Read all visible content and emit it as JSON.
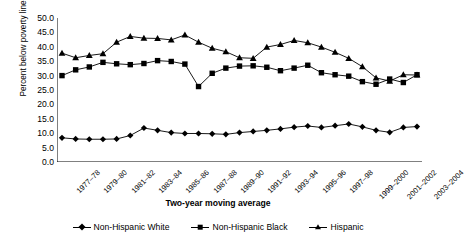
{
  "chart_data": {
    "type": "line",
    "title": "",
    "xlabel": "Two-year moving average",
    "ylabel": "Percent below poverty line",
    "ylim": [
      0.0,
      50.0
    ],
    "ytick_step": 5.0,
    "ytick_labels": [
      "50.0",
      "45.0",
      "40.0",
      "35.0",
      "30.0",
      "25.0",
      "20.0",
      "15.0",
      "10.0",
      "5.0",
      "0.0"
    ],
    "grid": false,
    "legend_position": "bottom",
    "categories": [
      "1977–78",
      "1978–79",
      "1979–80",
      "1980–81",
      "1981–82",
      "1982–83",
      "1983–84",
      "1984–85",
      "1985–86",
      "1986–87",
      "1987–88",
      "1988–89",
      "1989–90",
      "1990–91",
      "1991–92",
      "1992–93",
      "1993–94",
      "1994–95",
      "1995–96",
      "1996–97",
      "1997–98",
      "1998–99",
      "1999–2000",
      "2000–2001",
      "2001–2002",
      "2002–2003",
      "2003–2004"
    ],
    "xtick_labels_shown": [
      "1977–78",
      "1979–80",
      "1981–82",
      "1983–84",
      "1985–86",
      "1987–88",
      "1989–90",
      "1991–92",
      "1993–94",
      "1995–96",
      "1997–98",
      "1999–2000",
      "2001–2002",
      "2003–2004"
    ],
    "series": [
      {
        "name": "Non-Hispanic White",
        "marker": "diamond",
        "values": [
          8.4,
          8.0,
          7.9,
          7.9,
          8.0,
          9.2,
          11.8,
          11.0,
          10.2,
          9.9,
          9.9,
          9.8,
          9.6,
          10.2,
          10.6,
          11.0,
          11.5,
          12.1,
          12.5,
          12.0,
          12.6,
          13.2,
          12.2,
          11.0,
          10.3,
          12.0,
          12.3
        ]
      },
      {
        "name": "Non-Hispanic Black",
        "marker": "square",
        "values": [
          30.0,
          32.0,
          33.0,
          34.6,
          34.1,
          33.8,
          34.2,
          35.2,
          34.9,
          34.0,
          26.2,
          30.8,
          32.6,
          33.3,
          33.4,
          32.9,
          31.7,
          32.6,
          33.6,
          31.0,
          30.3,
          29.8,
          27.9,
          27.0,
          28.8,
          27.6,
          30.3
        ]
      },
      {
        "name": "Hispanic",
        "marker": "triangle",
        "values": [
          37.8,
          36.2,
          37.0,
          37.6,
          41.6,
          43.6,
          43.0,
          42.9,
          42.4,
          44.1,
          41.6,
          39.5,
          38.3,
          36.2,
          36.0,
          39.9,
          40.8,
          42.2,
          41.4,
          39.9,
          38.1,
          36.0,
          33.1,
          29.2,
          28.1,
          30.3,
          30.2
        ]
      }
    ]
  },
  "legend": {
    "items": [
      {
        "label": "Non-Hispanic White",
        "marker": "diamond"
      },
      {
        "label": "Non-Hispanic Black",
        "marker": "square"
      },
      {
        "label": "Hispanic",
        "marker": "triangle"
      }
    ]
  },
  "axes": {
    "x_title": "Two-year moving average",
    "y_title": "Percent below poverty line"
  }
}
